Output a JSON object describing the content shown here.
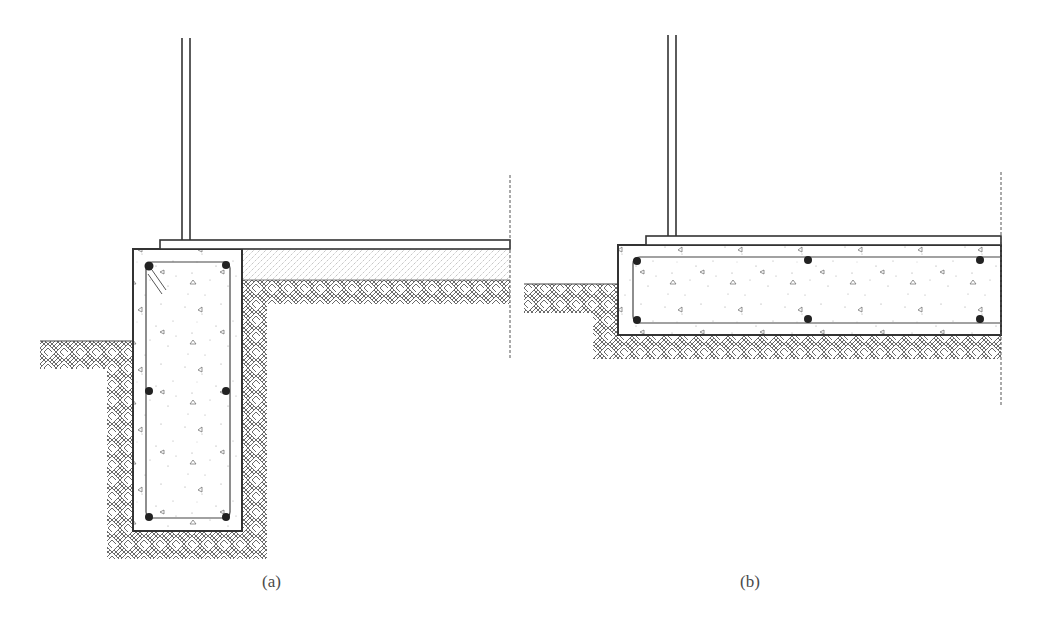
{
  "figure": {
    "panels": [
      {
        "id": "a",
        "caption": "(a)",
        "description": "Deep strip footing (perimeter foundation wall) with rebar at corners and mid-height, slab on gravel fill",
        "rebar_count": 6
      },
      {
        "id": "b",
        "caption": "(b)",
        "description": "Thickened slab-edge / shallow footing with top and bottom rebar",
        "rebar_count": 6
      }
    ],
    "legend": {
      "concrete": "stippled with triangular aggregate",
      "soil": "basket-weave hatch",
      "gravel_fill": "fine dotted diagonal hatch",
      "centerline": "dashed vertical line"
    }
  },
  "colors": {
    "line": "#3a3a3a",
    "hatch": "#555555",
    "background": "#ffffff",
    "caption": "#4a4a4a"
  }
}
